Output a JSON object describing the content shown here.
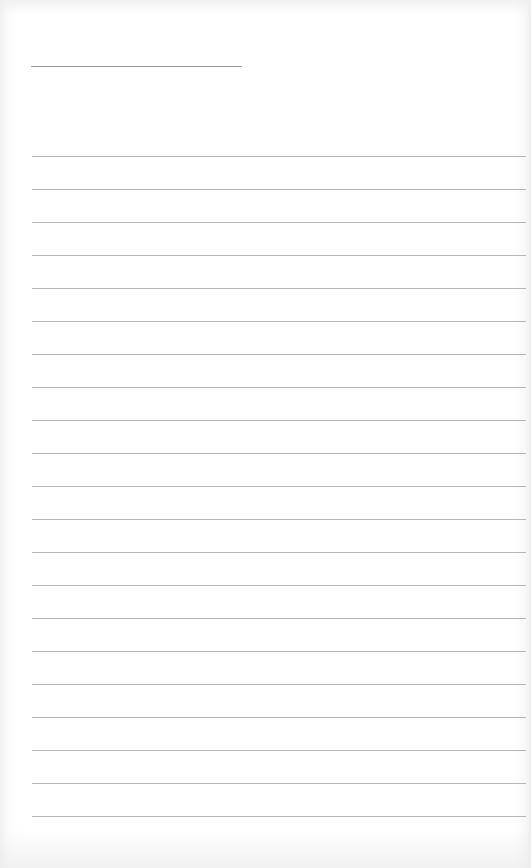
{
  "page": {
    "type": "lined-paper",
    "background": "#ffffff",
    "line_color": "#a8a8a8"
  },
  "title_line": {
    "x": 31,
    "y": 66,
    "width": 211,
    "text": ""
  },
  "ruled_lines": {
    "count": 21,
    "start_y": 156,
    "spacing": 33,
    "x": 32,
    "width": 494,
    "entries": [
      "",
      "",
      "",
      "",
      "",
      "",
      "",
      "",
      "",
      "",
      "",
      "",
      "",
      "",
      "",
      "",
      "",
      "",
      "",
      "",
      ""
    ]
  }
}
